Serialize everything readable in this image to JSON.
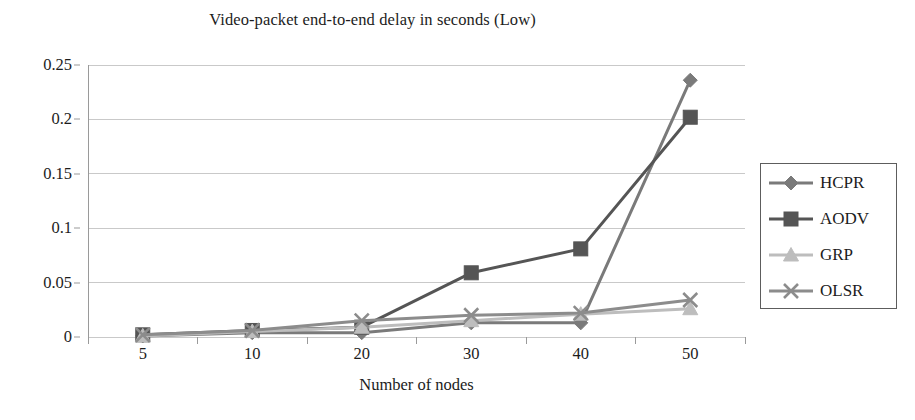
{
  "chart_data": {
    "type": "line",
    "title": "Video-packet end-to-end delay in seconds (Low)",
    "xlabel": "Number of nodes",
    "ylabel": "",
    "categories": [
      "5",
      "10",
      "20",
      "30",
      "40",
      "50"
    ],
    "x": [
      5,
      10,
      20,
      30,
      40,
      50
    ],
    "ylim": [
      0,
      0.25
    ],
    "yticks": [
      "0",
      "0.05",
      "0.1",
      "0.15",
      "0.2",
      "0.25"
    ],
    "ytick_values": [
      0,
      0.05,
      0.1,
      0.15,
      0.2,
      0.25
    ],
    "grid": "horizontal",
    "legend_position": "right",
    "series": [
      {
        "name": "HCPR",
        "marker": "diamond",
        "color": "#7a7a7a",
        "values": [
          0.001,
          0.004,
          0.004,
          0.013,
          0.013,
          0.236
        ]
      },
      {
        "name": "AODV",
        "marker": "square",
        "color": "#555555",
        "values": [
          0.002,
          0.006,
          0.009,
          0.059,
          0.081,
          0.202
        ]
      },
      {
        "name": "GRP",
        "marker": "triangle",
        "color": "#bdbdbd",
        "values": [
          0.001,
          0.005,
          0.009,
          0.015,
          0.021,
          0.026
        ]
      },
      {
        "name": "OLSR",
        "marker": "x",
        "color": "#8c8c8c",
        "values": [
          0.002,
          0.006,
          0.015,
          0.02,
          0.022,
          0.034
        ]
      }
    ]
  },
  "axes": {
    "gridline_color": "#c9c9c9",
    "axis_color": "#9a9a9a"
  },
  "legend": {
    "border_color": "#5d5d5d",
    "items": [
      {
        "label": "HCPR"
      },
      {
        "label": "AODV"
      },
      {
        "label": "GRP"
      },
      {
        "label": "OLSR"
      }
    ]
  }
}
